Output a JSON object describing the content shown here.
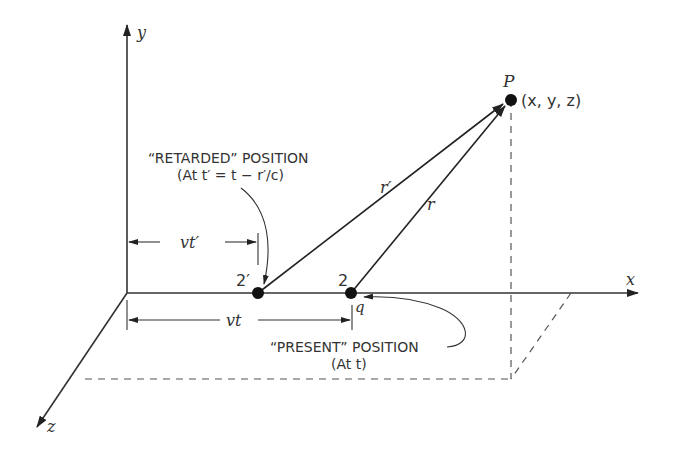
{
  "diagram": {
    "axes": {
      "x_label": "x",
      "y_label": "y",
      "z_label": "z"
    },
    "point_P": {
      "label": "P",
      "coords": "(x, y, z)"
    },
    "retarded_point": {
      "label": "2′"
    },
    "present_point": {
      "label": "2",
      "charge_label": "q"
    },
    "vectors": {
      "r_prime": "r′",
      "r": "r"
    },
    "dimensions": {
      "vt_prime": "vt′",
      "vt": "vt"
    },
    "annotations": {
      "retarded_title": "“RETARDED” POSITION",
      "retarded_sub": "(At t′ = t − r′/c)",
      "present_title": "“PRESENT” POSITION",
      "present_sub": "(At t)"
    },
    "colors": {
      "ink": "#333333",
      "dashed": "#555555",
      "background": "#ffffff"
    }
  }
}
